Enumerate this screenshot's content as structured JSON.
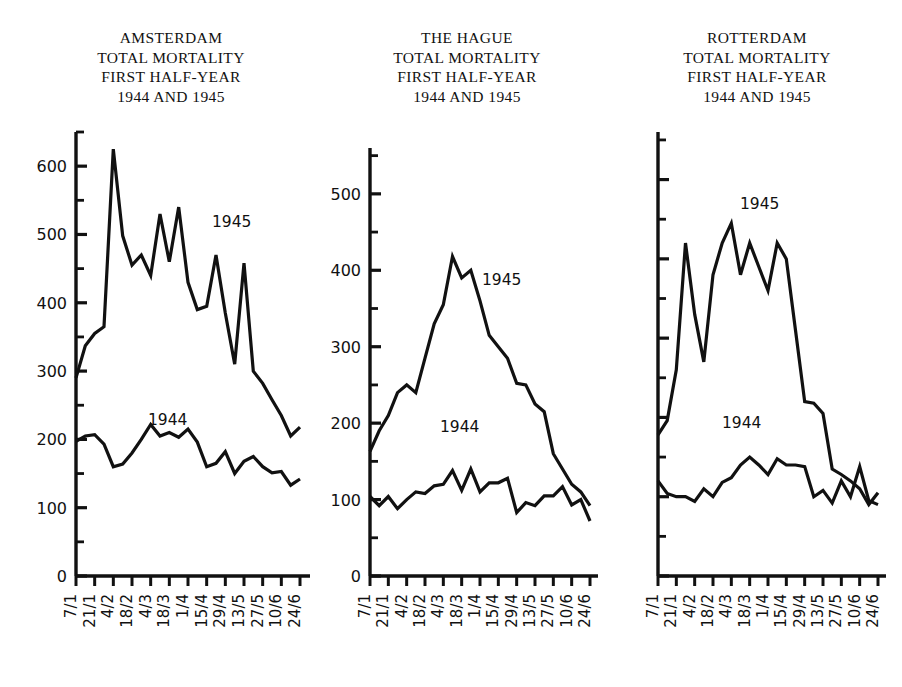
{
  "figure": {
    "panel_count": 3,
    "series_labels": {
      "a": "1944",
      "b": "1945"
    },
    "caption": ""
  },
  "panels": [
    {
      "id": "amsterdam",
      "title_lines": [
        "AMSTERDAM",
        "TOTAL MORTALITY",
        "FIRST HALF-YEAR",
        "1944 AND 1945"
      ],
      "y_labels": [
        "0",
        "100",
        "200",
        "300",
        "400",
        "500",
        "600"
      ],
      "label_1944": "1944",
      "label_1945": "1945"
    },
    {
      "id": "the-hague",
      "title_lines": [
        "THE HAGUE",
        "TOTAL MORTALITY",
        "FIRST HALF-YEAR",
        "1944 AND 1945"
      ],
      "y_labels": [
        "0",
        "100",
        "200",
        "300",
        "400",
        "500"
      ],
      "label_1944": "1944",
      "label_1945": "1945"
    },
    {
      "id": "rotterdam",
      "title_lines": [
        "ROTTERDAM",
        "TOTAL MORTALITY",
        "FIRST HALF-YEAR",
        "1944 AND 1945"
      ],
      "y_labels": [],
      "label_1944": "1944",
      "label_1945": "1945"
    }
  ],
  "x_labels": [
    "7/1",
    "21/1",
    "4/2",
    "18/2",
    "4/3",
    "18/3",
    "1/4",
    "15/4",
    "29/4",
    "13/5",
    "27/5",
    "10/6",
    "24/6"
  ],
  "chart_data": [
    {
      "type": "line",
      "title": "AMSTERDAM TOTAL MORTALITY FIRST HALF-YEAR 1944 AND 1945",
      "xlabel": "",
      "ylabel": "",
      "ylim": [
        0,
        650
      ],
      "yticks": [
        0,
        100,
        200,
        300,
        400,
        500,
        600
      ],
      "minor_ytick_step": 50,
      "grid": false,
      "legend": "inline-annotation",
      "x": [
        "7/1",
        "14/1",
        "21/1",
        "28/1",
        "4/2",
        "11/2",
        "18/2",
        "25/2",
        "4/3",
        "11/3",
        "18/3",
        "25/3",
        "1/4",
        "8/4",
        "15/4",
        "22/4",
        "29/4",
        "6/5",
        "13/5",
        "20/5",
        "27/5",
        "3/6",
        "10/6",
        "17/6",
        "24/6"
      ],
      "series": [
        {
          "name": "1944",
          "values": [
            197,
            205,
            207,
            193,
            160,
            164,
            180,
            200,
            222,
            205,
            210,
            203,
            215,
            196,
            160,
            165,
            182,
            150,
            168,
            175,
            160,
            151,
            153,
            133,
            142
          ]
        },
        {
          "name": "1945",
          "values": [
            290,
            337,
            355,
            365,
            625,
            498,
            455,
            470,
            440,
            530,
            460,
            540,
            430,
            390,
            395,
            470,
            385,
            310,
            458,
            300,
            282,
            258,
            235,
            205,
            218
          ]
        }
      ]
    },
    {
      "type": "line",
      "title": "THE HAGUE TOTAL MORTALITY FIRST HALF-YEAR 1944 AND 1945",
      "xlabel": "",
      "ylabel": "",
      "ylim": [
        0,
        560
      ],
      "yticks": [
        0,
        100,
        200,
        300,
        400,
        500
      ],
      "minor_ytick_step": 50,
      "grid": false,
      "legend": "inline-annotation",
      "x": [
        "7/1",
        "14/1",
        "21/1",
        "28/1",
        "4/2",
        "11/2",
        "18/2",
        "25/2",
        "4/3",
        "11/3",
        "18/3",
        "25/3",
        "1/4",
        "8/4",
        "15/4",
        "22/4",
        "29/4",
        "6/5",
        "13/5",
        "20/5",
        "27/5",
        "3/6",
        "10/6",
        "17/6",
        "24/6"
      ],
      "series": [
        {
          "name": "1944",
          "values": [
            104,
            92,
            104,
            88,
            100,
            110,
            108,
            118,
            120,
            138,
            112,
            140,
            110,
            122,
            122,
            128,
            83,
            96,
            92,
            105,
            105,
            117,
            93,
            100,
            72
          ]
        },
        {
          "name": "1945",
          "values": [
            163,
            190,
            210,
            240,
            250,
            240,
            285,
            330,
            355,
            418,
            390,
            400,
            360,
            315,
            300,
            285,
            252,
            250,
            225,
            215,
            160,
            140,
            120,
            110,
            92
          ]
        }
      ]
    },
    {
      "type": "line",
      "title": "ROTTERDAM TOTAL MORTALITY FIRST HALF-YEAR 1944 AND 1945",
      "xlabel": "",
      "ylabel": "",
      "ylim": [
        0,
        560
      ],
      "yticks": [
        0,
        100,
        200,
        300,
        400,
        500
      ],
      "minor_ytick_step": 50,
      "grid": false,
      "legend": "inline-annotation",
      "x": [
        "7/1",
        "14/1",
        "21/1",
        "28/1",
        "4/2",
        "11/2",
        "18/2",
        "25/2",
        "4/3",
        "11/3",
        "18/3",
        "25/3",
        "1/4",
        "8/4",
        "15/4",
        "22/4",
        "29/4",
        "6/5",
        "13/5",
        "20/5",
        "27/5",
        "3/6",
        "10/6",
        "17/6",
        "24/6"
      ],
      "series": [
        {
          "name": "1944",
          "values": [
            120,
            104,
            100,
            100,
            94,
            110,
            100,
            118,
            124,
            140,
            150,
            140,
            128,
            148,
            140,
            140,
            138,
            100,
            108,
            92,
            120,
            100,
            138,
            95,
            90
          ]
        },
        {
          "name": "1945",
          "values": [
            178,
            196,
            260,
            420,
            330,
            270,
            380,
            420,
            445,
            380,
            420,
            390,
            360,
            420,
            400,
            310,
            220,
            218,
            205,
            135,
            128,
            120,
            110,
            90,
            105
          ]
        }
      ]
    }
  ]
}
